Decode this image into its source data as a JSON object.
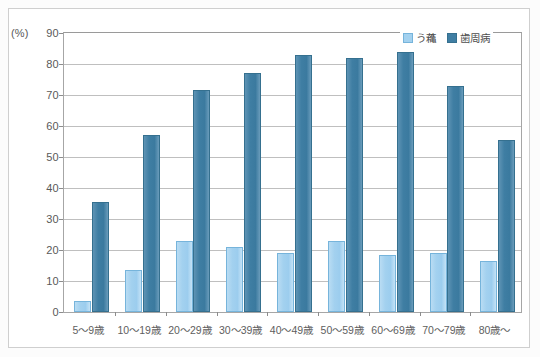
{
  "chart_data": {
    "type": "bar",
    "title": "",
    "subtitle": "",
    "xlabel": "",
    "ylabel": "(%)",
    "ylim": [
      0,
      90
    ],
    "ytick_step": 10,
    "yticks": [
      "90",
      "80",
      "70",
      "60",
      "50",
      "40",
      "30",
      "20",
      "10",
      "0"
    ],
    "grid": true,
    "legend_position": "top-right",
    "categories": [
      "5〜9歳",
      "10〜19歳",
      "20〜29歳",
      "30〜39歳",
      "40〜49歳",
      "50〜59歳",
      "60〜69歳",
      "70〜79歳",
      "80歳〜"
    ],
    "series": [
      {
        "name": "う蘒",
        "color": "#a3d1ef",
        "border_color": "#76b4db",
        "values": [
          3.5,
          13.5,
          23.0,
          21.0,
          19.0,
          23.0,
          18.5,
          19.0,
          16.5
        ]
      },
      {
        "name": "歯周病",
        "color": "#3f7ea3",
        "border_color": "#35708f",
        "values": [
          35.5,
          57.0,
          71.5,
          77.0,
          83.0,
          82.0,
          84.0,
          73.0,
          55.5
        ]
      }
    ]
  },
  "axes": {
    "y_unit_label": "(%)"
  },
  "legend": {
    "items": [
      {
        "label": "う蘒",
        "swatch": "light-blue-swatch"
      },
      {
        "label": "歯周病",
        "swatch": "dark-blue-swatch"
      }
    ]
  },
  "colors": {
    "caries": "#a3d1ef",
    "perio": "#3f7ea3",
    "gridline": "#bfbfbf",
    "axis": "#a6a6a6",
    "text": "#595959",
    "background": "#ffffff"
  }
}
